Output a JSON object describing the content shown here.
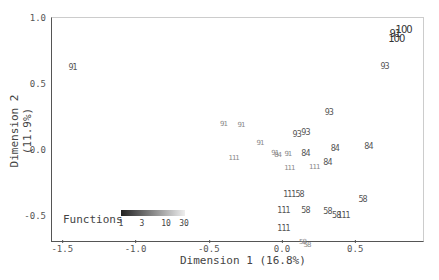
{
  "chart_data": {
    "type": "scatter",
    "title": "",
    "xlabel": "Dimension 1 (16.8%)",
    "ylabel": "Dimension 2 (11.9%)",
    "xlim": [
      -1.58,
      0.95
    ],
    "ylim": [
      -0.7,
      1.0
    ],
    "x_ticks": [
      "-1.5",
      "-1.0",
      "-0.5",
      "0.0",
      "0.5"
    ],
    "y_ticks": [
      "1.0",
      "0.5",
      "0.0",
      "-0.5"
    ],
    "grid": false,
    "legend": {
      "title": "Functions",
      "type": "gradient",
      "ticks": [
        "1",
        "3",
        "10",
        "30"
      ],
      "position": "bottom-left"
    },
    "points": [
      {
        "label": "91",
        "x": -1.43,
        "y": 0.62,
        "size": 8
      },
      {
        "label": "100",
        "x": 0.83,
        "y": 0.91,
        "size": 10
      },
      {
        "label": "91",
        "x": 0.77,
        "y": 0.88,
        "size": 10
      },
      {
        "label": "100",
        "x": 0.78,
        "y": 0.84,
        "size": 10
      },
      {
        "label": "93",
        "x": 0.7,
        "y": 0.63,
        "size": 8
      },
      {
        "label": "93",
        "x": 0.32,
        "y": 0.28,
        "size": 8
      },
      {
        "label": "93",
        "x": 0.1,
        "y": 0.11,
        "size": 8
      },
      {
        "label": "93",
        "x": 0.16,
        "y": 0.13,
        "size": 8
      },
      {
        "label": "84",
        "x": 0.36,
        "y": 0.01,
        "size": 8
      },
      {
        "label": "84",
        "x": 0.59,
        "y": 0.02,
        "size": 8
      },
      {
        "label": "84",
        "x": 0.16,
        "y": -0.03,
        "size": 8
      },
      {
        "label": "84",
        "x": 0.31,
        "y": -0.1,
        "size": 8
      },
      {
        "label": "91",
        "x": -0.4,
        "y": 0.2,
        "size": 7
      },
      {
        "label": "91",
        "x": -0.28,
        "y": 0.19,
        "size": 7
      },
      {
        "label": "91",
        "x": -0.15,
        "y": 0.05,
        "size": 7
      },
      {
        "label": "91",
        "x": -0.05,
        "y": -0.02,
        "size": 7
      },
      {
        "label": "91",
        "x": 0.04,
        "y": -0.03,
        "size": 7
      },
      {
        "label": "84",
        "x": -0.03,
        "y": -0.04,
        "size": 7
      },
      {
        "label": "111",
        "x": -0.33,
        "y": -0.06,
        "size": 7
      },
      {
        "label": "111",
        "x": 0.05,
        "y": -0.14,
        "size": 7
      },
      {
        "label": "111",
        "x": 0.22,
        "y": -0.13,
        "size": 7
      },
      {
        "label": "111",
        "x": 0.05,
        "y": -0.34,
        "size": 8
      },
      {
        "label": "58",
        "x": 0.12,
        "y": -0.34,
        "size": 8
      },
      {
        "label": "58",
        "x": 0.55,
        "y": -0.38,
        "size": 8
      },
      {
        "label": "111",
        "x": 0.01,
        "y": -0.46,
        "size": 8
      },
      {
        "label": "58",
        "x": 0.16,
        "y": -0.46,
        "size": 8
      },
      {
        "label": "58",
        "x": 0.31,
        "y": -0.47,
        "size": 8
      },
      {
        "label": "58",
        "x": 0.37,
        "y": -0.5,
        "size": 8
      },
      {
        "label": "111",
        "x": 0.42,
        "y": -0.5,
        "size": 8
      },
      {
        "label": "111",
        "x": 0.01,
        "y": -0.6,
        "size": 8
      },
      {
        "label": "58",
        "x": 0.14,
        "y": -0.7,
        "size": 7
      },
      {
        "label": "58",
        "x": 0.17,
        "y": -0.72,
        "size": 7
      }
    ]
  }
}
